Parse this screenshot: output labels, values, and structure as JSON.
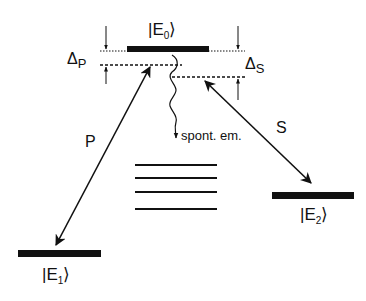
{
  "diagram": {
    "type": "energy-level-diagram",
    "levels": {
      "E0": {
        "label_prefix": "|E",
        "sub": "0",
        "label_suffix": "⟩"
      },
      "E1": {
        "label_prefix": "|E",
        "sub": "1",
        "label_suffix": "⟩"
      },
      "E2": {
        "label_prefix": "|E",
        "sub": "2",
        "label_suffix": "⟩"
      }
    },
    "detunings": {
      "pump": {
        "symbol": "Δ",
        "sub": "P"
      },
      "stokes": {
        "symbol": "Δ",
        "sub": "S"
      }
    },
    "transitions": {
      "pump_label": "P",
      "stokes_label": "S",
      "spontaneous_label": "spont. em."
    },
    "other_levels_count": 4,
    "colors": {
      "ink": "#111111",
      "background": "#ffffff"
    }
  }
}
